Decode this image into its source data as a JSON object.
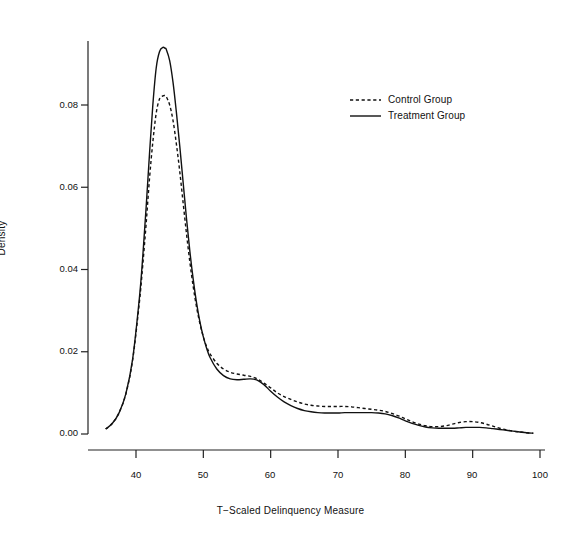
{
  "chart_data": {
    "type": "line",
    "title": "",
    "xlabel": "T−Scaled Delinquency Measure",
    "ylabel": "Density",
    "xlim": [
      35,
      101
    ],
    "ylim": [
      0.0,
      0.0985
    ],
    "grid": false,
    "legend_position": "top-right",
    "xticks": [
      40,
      50,
      60,
      70,
      80,
      90,
      100
    ],
    "xtick_labels": [
      "40",
      "50",
      "60",
      "70",
      "80",
      "90",
      "100"
    ],
    "yticks": [
      0.0,
      0.02,
      0.04,
      0.06,
      0.08
    ],
    "ytick_labels": [
      "0.00",
      "0.02",
      "0.04",
      "0.06",
      "0.08"
    ],
    "x": [
      35.5,
      36.5,
      37.5,
      38.5,
      39.5,
      40.5,
      41.0,
      41.5,
      42.0,
      42.5,
      43.0,
      43.5,
      44.0,
      44.3,
      44.5,
      45.0,
      45.5,
      46.0,
      46.5,
      47.0,
      47.5,
      48.0,
      48.5,
      49.0,
      49.5,
      50.0,
      50.5,
      51.0,
      52.0,
      53.0,
      54.0,
      55.0,
      56.0,
      57.0,
      58.0,
      59.0,
      60.0,
      61.0,
      62.0,
      63.0,
      64.0,
      65.0,
      66.0,
      67.0,
      68.0,
      69.0,
      70.0,
      71.0,
      72.0,
      73.0,
      74.0,
      75.0,
      76.0,
      77.0,
      78.0,
      79.0,
      80.0,
      81.0,
      82.0,
      83.0,
      84.0,
      85.0,
      86.0,
      87.0,
      88.0,
      89.0,
      90.0,
      91.0,
      92.0,
      93.0,
      94.0,
      95.0,
      96.0,
      97.0,
      98.0,
      99.0
    ],
    "series": [
      {
        "name": "Control Group",
        "style": "dashed",
        "color": "#111111",
        "values": [
          0.0012,
          0.0026,
          0.0052,
          0.0098,
          0.018,
          0.032,
          0.041,
          0.051,
          0.062,
          0.071,
          0.078,
          0.0815,
          0.0822,
          0.0823,
          0.082,
          0.08,
          0.0762,
          0.0705,
          0.0638,
          0.0562,
          0.0487,
          0.0418,
          0.0358,
          0.0308,
          0.0268,
          0.0236,
          0.0212,
          0.0195,
          0.0172,
          0.0158,
          0.015,
          0.0146,
          0.0143,
          0.014,
          0.0134,
          0.0124,
          0.0112,
          0.01,
          0.0091,
          0.0084,
          0.0078,
          0.0073,
          0.007,
          0.0068,
          0.0067,
          0.0067,
          0.0067,
          0.0067,
          0.0066,
          0.0064,
          0.0062,
          0.006,
          0.0058,
          0.0055,
          0.005,
          0.0044,
          0.0037,
          0.003,
          0.0024,
          0.002,
          0.0018,
          0.0018,
          0.002,
          0.0024,
          0.0028,
          0.003,
          0.003,
          0.0028,
          0.0024,
          0.0019,
          0.0014,
          0.001,
          0.0007,
          0.0005,
          0.0003,
          0.0002
        ]
      },
      {
        "name": "Treatment Group",
        "style": "solid",
        "color": "#111111",
        "values": [
          0.0012,
          0.0026,
          0.0052,
          0.0098,
          0.0182,
          0.033,
          0.043,
          0.055,
          0.068,
          0.08,
          0.089,
          0.093,
          0.094,
          0.0938,
          0.0935,
          0.0908,
          0.0855,
          0.0782,
          0.07,
          0.0612,
          0.0524,
          0.0444,
          0.0376,
          0.0318,
          0.0272,
          0.0236,
          0.0208,
          0.0186,
          0.0158,
          0.0142,
          0.0134,
          0.0132,
          0.0133,
          0.0134,
          0.0131,
          0.012,
          0.0104,
          0.009,
          0.0078,
          0.0069,
          0.0062,
          0.0057,
          0.0054,
          0.0052,
          0.0051,
          0.0051,
          0.0051,
          0.0052,
          0.0052,
          0.0052,
          0.0052,
          0.0052,
          0.0051,
          0.0049,
          0.0045,
          0.0039,
          0.0032,
          0.0026,
          0.0021,
          0.0017,
          0.0015,
          0.0014,
          0.0014,
          0.0014,
          0.0015,
          0.0016,
          0.0016,
          0.0016,
          0.0015,
          0.0013,
          0.0011,
          0.0009,
          0.0007,
          0.0005,
          0.0003,
          0.0002
        ]
      }
    ],
    "legend": [
      {
        "label": "Control Group",
        "style": "dashed"
      },
      {
        "label": "Treatment Group",
        "style": "solid"
      }
    ]
  },
  "axes": {
    "y_title": "Density",
    "x_title": "T−Scaled Delinquency Measure",
    "ytick_labels": [
      "0.08",
      "0.06",
      "0.04",
      "0.02",
      "0.00"
    ],
    "xtick_labels": [
      "40",
      "50",
      "60",
      "70",
      "80",
      "90",
      "100"
    ]
  },
  "legend": {
    "control_label": "Control Group",
    "treatment_label": "Treatment Group"
  }
}
